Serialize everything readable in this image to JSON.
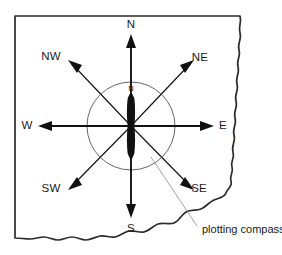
{
  "figure": {
    "background_color": "#ffffff",
    "ink_color": "#111111",
    "edge_color": "#2b2b2b",
    "circle_color": "#555555",
    "leader_color": "#8a8a8a",
    "width": 282,
    "height": 255
  },
  "compass": {
    "center_x": 131,
    "center_y": 126,
    "circle_radius": 44,
    "needle_label": "N",
    "needle_label_x": 131,
    "needle_label_y": 89,
    "needle_color": "#111111"
  },
  "directions": [
    {
      "key": "north",
      "label": "N",
      "label_x": 131,
      "label_y": 25,
      "bearing_deg": 0,
      "style": "cardinal"
    },
    {
      "key": "northeast",
      "label": "NE",
      "label_x": 200,
      "label_y": 58,
      "bearing_deg": 45,
      "style": "ordinal"
    },
    {
      "key": "east",
      "label": "E",
      "label_x": 223,
      "label_y": 126,
      "bearing_deg": 90,
      "style": "cardinal"
    },
    {
      "key": "southeast",
      "label": "SE",
      "label_x": 199,
      "label_y": 189,
      "bearing_deg": 135,
      "style": "ordinal"
    },
    {
      "key": "south",
      "label": "S",
      "label_x": 131,
      "label_y": 229,
      "bearing_deg": 180,
      "style": "cardinal"
    },
    {
      "key": "southwest",
      "label": "SW",
      "label_x": 51,
      "label_y": 189,
      "bearing_deg": 225,
      "style": "ordinal"
    },
    {
      "key": "west",
      "label": "W",
      "label_x": 27,
      "label_y": 126,
      "bearing_deg": 270,
      "style": "cardinal"
    },
    {
      "key": "northwest",
      "label": "NW",
      "label_x": 51,
      "label_y": 57,
      "bearing_deg": 315,
      "style": "ordinal"
    }
  ],
  "callout": {
    "label": "plotting compass",
    "label_x": 202,
    "label_y": 230,
    "leader_from_x": 151,
    "leader_from_y": 157,
    "leader_to_x": 197,
    "leader_to_y": 226
  }
}
